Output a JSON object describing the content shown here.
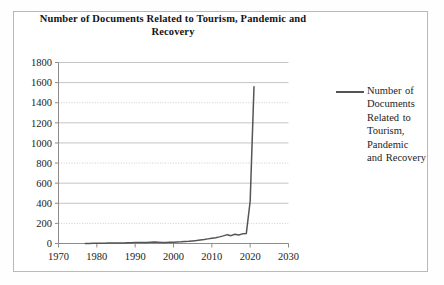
{
  "chart_data": {
    "type": "line",
    "title": "Number of Documents Related to Tourism, Pandemic and Recovery",
    "xlabel": "",
    "ylabel": "",
    "xlim": [
      1970,
      2030
    ],
    "ylim": [
      0,
      1800
    ],
    "xticks": [
      1970,
      1980,
      1990,
      2000,
      2010,
      2020,
      2030
    ],
    "yticks": [
      0,
      200,
      400,
      600,
      800,
      1000,
      1200,
      1400,
      1600,
      1800
    ],
    "grid": "horizontal",
    "legend_position": "right",
    "series": [
      {
        "name": "Number of Documents Related to Tourism, Pandemic and Recovery",
        "color": "#555555",
        "x": [
          1977,
          1978,
          1979,
          1980,
          1981,
          1982,
          1983,
          1984,
          1985,
          1986,
          1987,
          1988,
          1989,
          1990,
          1991,
          1992,
          1993,
          1994,
          1995,
          1996,
          1997,
          1998,
          1999,
          2000,
          2001,
          2002,
          2003,
          2004,
          2005,
          2006,
          2007,
          2008,
          2009,
          2010,
          2011,
          2012,
          2013,
          2014,
          2015,
          2016,
          2017,
          2018,
          2019,
          2020,
          2021
        ],
        "values": [
          1,
          1,
          2,
          2,
          3,
          3,
          4,
          4,
          5,
          5,
          6,
          7,
          8,
          9,
          10,
          11,
          10,
          12,
          14,
          13,
          11,
          10,
          12,
          13,
          15,
          17,
          20,
          22,
          26,
          30,
          35,
          40,
          46,
          52,
          58,
          66,
          76,
          88,
          78,
          92,
          85,
          96,
          100,
          420,
          1560
        ]
      }
    ]
  },
  "legend": {
    "entries": [
      {
        "label": "Number of Documents Related to Tourism, Pandemic and Recovery",
        "color": "#555555"
      }
    ]
  }
}
